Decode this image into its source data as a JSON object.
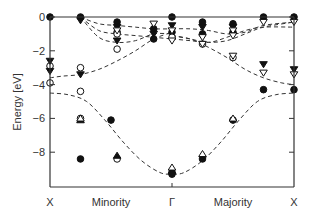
{
  "chart_data": {
    "type": "scatter",
    "title": "",
    "xlabel": "",
    "ylabel": "Energy [eV]",
    "ylim": [
      -10.05,
      0.2
    ],
    "yticks": [
      0,
      -2,
      -4,
      -6,
      -8
    ],
    "ytick_labels": [
      "0",
      "−2",
      "−4",
      "−6",
      "−8"
    ],
    "x_positions": [
      {
        "label": "X",
        "pos": 0.0
      },
      {
        "label": "Minority",
        "pos": 0.5,
        "role": "region"
      },
      {
        "label": "Γ",
        "pos": 1.0
      },
      {
        "label": "Majority",
        "pos": 1.5,
        "role": "region"
      },
      {
        "label": "X",
        "pos": 2.0
      }
    ],
    "grid": false,
    "legend": null,
    "dashed_bands": [
      {
        "name": "lowest band",
        "x": [
          0.0,
          0.15,
          0.3,
          0.45,
          0.6,
          0.75,
          0.9,
          1.0,
          1.1,
          1.25,
          1.4,
          1.55,
          1.7,
          1.85,
          2.0
        ],
        "y": [
          -4.5,
          -4.6,
          -5.0,
          -6.1,
          -7.4,
          -8.5,
          -9.2,
          -9.3,
          -9.2,
          -8.5,
          -7.4,
          -6.1,
          -5.0,
          -4.6,
          -4.5
        ]
      },
      {
        "name": "band minority s-d",
        "x": [
          0.0,
          0.1,
          0.25,
          0.4,
          0.55,
          0.7,
          0.85,
          1.0
        ],
        "y": [
          -3.6,
          -3.5,
          -3.4,
          -3.1,
          -2.6,
          -2.0,
          -1.3,
          -0.9
        ]
      },
      {
        "name": "band majority s-d",
        "x": [
          1.0,
          1.15,
          1.3,
          1.45,
          1.6,
          1.75,
          1.9,
          2.0
        ],
        "y": [
          -1.1,
          -1.3,
          -1.8,
          -2.4,
          -3.1,
          -3.6,
          -3.9,
          -4.0
        ]
      },
      {
        "name": "minority d1",
        "x": [
          0.25,
          0.4,
          0.55,
          0.7,
          0.85,
          1.0
        ],
        "y": [
          0.0,
          -0.4,
          -0.5,
          -0.6,
          -0.7,
          -0.7
        ]
      },
      {
        "name": "minority d2",
        "x": [
          0.25,
          0.4,
          0.55,
          0.7,
          0.85,
          1.0
        ],
        "y": [
          0.0,
          -0.8,
          -1.0,
          -1.1,
          -1.2,
          -1.3
        ]
      },
      {
        "name": "minority d3",
        "x": [
          0.25,
          0.4,
          0.55,
          0.7,
          0.85,
          1.0
        ],
        "y": [
          0.0,
          -1.2,
          -1.5,
          -1.4,
          -1.0,
          -1.0
        ]
      },
      {
        "name": "majority d1",
        "x": [
          1.0,
          1.15,
          1.3,
          1.45,
          1.6,
          1.75,
          2.0
        ],
        "y": [
          -0.7,
          -0.7,
          -0.8,
          -1.0,
          -0.9,
          -0.5,
          -0.3
        ]
      },
      {
        "name": "majority d2",
        "x": [
          1.0,
          1.15,
          1.3,
          1.45,
          1.6,
          1.75,
          2.0
        ],
        "y": [
          -1.3,
          -1.4,
          -1.5,
          -1.4,
          -1.0,
          -0.6,
          -0.3
        ]
      },
      {
        "name": "majority d3",
        "x": [
          1.0,
          1.15,
          1.3,
          1.45,
          1.6,
          1.75,
          2.0
        ],
        "y": [
          -1.1,
          -1.3,
          -1.5,
          -1.2,
          -0.8,
          -0.6,
          -0.6
        ]
      }
    ],
    "series": [
      {
        "name": "filled circles",
        "marker": "circle-filled",
        "x": [
          0.0,
          0.25,
          0.55,
          0.55,
          0.85,
          0.85,
          1.0,
          1.0,
          1.0,
          1.25,
          1.25,
          1.5,
          1.5,
          1.75,
          1.75,
          2.0,
          2.0,
          1.5,
          1.25,
          1.0,
          0.5,
          0.25
        ],
        "y": [
          0.0,
          0.0,
          -0.3,
          -0.9,
          -0.7,
          -1.3,
          0.0,
          -0.9,
          -9.2,
          -0.3,
          -1.0,
          -0.4,
          -0.9,
          0.0,
          -4.3,
          0.0,
          -4.3,
          -6.1,
          -8.4,
          -9.3,
          -6.1,
          -8.4
        ]
      },
      {
        "name": "open circles",
        "marker": "circle-open",
        "x": [
          0.0,
          0.0,
          0.25,
          0.25,
          0.55,
          0.55,
          1.0,
          1.25,
          1.5,
          0.25,
          0.55
        ],
        "y": [
          -2.9,
          -3.9,
          -3.0,
          -4.4,
          -1.0,
          -1.9,
          -1.2,
          -1.6,
          -2.4,
          -6.0,
          -8.4
        ]
      },
      {
        "name": "filled down triangles",
        "marker": "triangle-down-filled",
        "x": [
          0.0,
          0.0,
          0.25,
          0.25,
          0.55,
          0.55,
          0.85,
          1.0,
          1.25,
          1.5,
          1.75,
          2.0
        ],
        "y": [
          -2.6,
          -3.2,
          -0.2,
          -3.4,
          -0.6,
          -1.4,
          -1.0,
          -0.5,
          -0.6,
          -0.6,
          -2.8,
          -3.1
        ]
      },
      {
        "name": "open down triangles",
        "marker": "triangle-down-open",
        "x": [
          0.55,
          0.85,
          1.0,
          1.0,
          1.25,
          1.25,
          1.5,
          1.5,
          1.75,
          1.75,
          2.0,
          2.0,
          1.5
        ],
        "y": [
          -0.8,
          -0.4,
          -1.4,
          -0.8,
          -1.2,
          -1.6,
          -0.8,
          -1.1,
          -0.3,
          -3.3,
          -0.3,
          -3.4,
          -2.3
        ]
      },
      {
        "name": "filled up triangles",
        "marker": "triangle-up-filled",
        "x": [
          0.25,
          0.55,
          1.0
        ],
        "y": [
          -6.1,
          -8.2,
          -9.1
        ]
      },
      {
        "name": "open up triangles",
        "marker": "triangle-up-open",
        "x": [
          0.25,
          1.0,
          1.25,
          1.5
        ],
        "y": [
          -6.0,
          -8.9,
          -8.1,
          -6.0
        ]
      }
    ]
  }
}
